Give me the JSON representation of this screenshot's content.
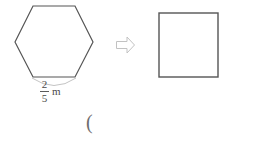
{
  "canvas": {
    "width": 254,
    "height": 141,
    "background": "#ffffff"
  },
  "colors": {
    "shape_stroke": "#555555",
    "brace_stroke": "#b9b9b9",
    "arrow_stroke": "#c2c2c2",
    "text": "#4a4a4a",
    "paren": "#6e6e6e"
  },
  "figure": {
    "hexagon": {
      "name": "regular-hexagon",
      "sides": 6,
      "points": "15,42 33,6 75,6 93,42 75,77 33,77",
      "stroke": "#555555",
      "stroke_width": 1.2,
      "fill": "none"
    },
    "side_brace": {
      "name": "side-length-brace",
      "path": "M 32 78 Q 54 92 76 78",
      "stroke": "#c4c4c4",
      "stroke_width": 1
    },
    "arrow": {
      "name": "transform-arrow",
      "direction": "right",
      "glyph": "block-arrow",
      "path": "M 116 43 L 127 43 L 127 38.5 L 134 45 L 127 51.5 L 127 47 L 116 47 Z",
      "stroke": "#c2c2c2",
      "stroke_width": 1,
      "fill": "#ffffff"
    },
    "square": {
      "name": "square",
      "x": 159,
      "y": 13,
      "width": 59,
      "height": 64,
      "stroke": "#555555",
      "stroke_width": 1.4,
      "fill": "none"
    }
  },
  "labels": {
    "side_length": {
      "numerator": "2",
      "denominator": "5",
      "unit": "m",
      "full_text": "2/5 m"
    },
    "stray_paren": "("
  }
}
